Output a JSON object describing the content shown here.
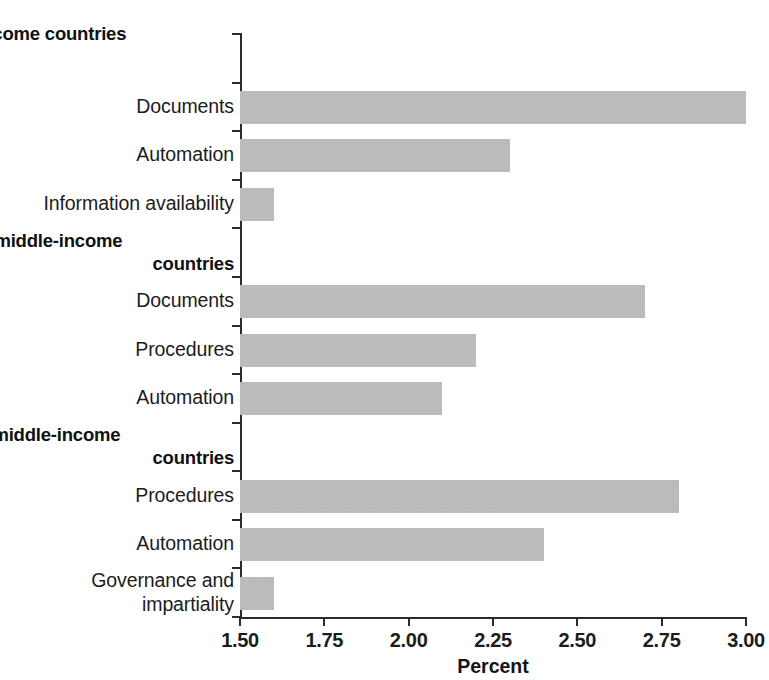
{
  "chart_data": {
    "type": "bar",
    "orientation": "horizontal",
    "title": "",
    "xlabel": "Percent",
    "ylabel": "",
    "xlim": [
      1.5,
      3.0
    ],
    "xticks": [
      "1.50",
      "1.75",
      "2.00",
      "2.25",
      "2.50",
      "2.75",
      "3.00"
    ],
    "xtick_values": [
      1.5,
      1.75,
      2.0,
      2.25,
      2.5,
      2.75,
      3.0
    ],
    "grid": false,
    "legend": null,
    "bar_color": "#b3b3b3",
    "axis_color": "#2b2b2b",
    "panels": [
      {
        "key": "a",
        "title": "a. Low-income countries",
        "title_lines": [
          "a. Low-income countries"
        ],
        "categories": [
          "Documents",
          "Automation",
          "Information availability"
        ],
        "values": [
          3.0,
          2.3,
          1.6
        ]
      },
      {
        "key": "b",
        "title": "b. Lower-middle-income countries",
        "title_lines": [
          "b. Lower-middle-income",
          "countries"
        ],
        "categories": [
          "Documents",
          "Procedures",
          "Automation"
        ],
        "values": [
          2.7,
          2.2,
          2.1
        ]
      },
      {
        "key": "c",
        "title": "c. Upper-middle-income countries",
        "title_lines": [
          "c. Upper-middle-income",
          "countries"
        ],
        "categories": [
          "Procedures",
          "Automation",
          "Governance and impartiality"
        ],
        "values": [
          2.8,
          2.4,
          1.6
        ]
      }
    ],
    "categories": [
      "Documents",
      "Automation",
      "Information availability",
      "Documents",
      "Procedures",
      "Automation",
      "Procedures",
      "Automation",
      "Governance and impartiality"
    ],
    "values": [
      3.0,
      2.3,
      1.6,
      2.7,
      2.2,
      2.1,
      2.8,
      2.4,
      1.6
    ]
  },
  "rows": [
    {
      "kind": "title",
      "panel": 0,
      "line1": "a. Low-income countries",
      "line2": ""
    },
    {
      "kind": "bar",
      "label": "Documents",
      "value": 3.0
    },
    {
      "kind": "bar",
      "label": "Automation",
      "value": 2.3
    },
    {
      "kind": "bar",
      "label": "Information availability",
      "value": 1.6
    },
    {
      "kind": "title",
      "panel": 1,
      "line1": "b. Lower-middle-income",
      "line2": "countries"
    },
    {
      "kind": "bar",
      "label": "Documents",
      "value": 2.7
    },
    {
      "kind": "bar",
      "label": "Procedures",
      "value": 2.2
    },
    {
      "kind": "bar",
      "label": "Automation",
      "value": 2.1
    },
    {
      "kind": "title",
      "panel": 2,
      "line1": "c. Upper-middle-income",
      "line2": "countries"
    },
    {
      "kind": "bar",
      "label": "Procedures",
      "value": 2.8
    },
    {
      "kind": "bar",
      "label": "Automation",
      "value": 2.4
    },
    {
      "kind": "bar",
      "label": "Governance and impartiality",
      "value": 1.6
    }
  ],
  "axis": {
    "x_title": "Percent",
    "ticks": [
      "1.50",
      "1.75",
      "2.00",
      "2.25",
      "2.50",
      "2.75",
      "3.00"
    ]
  }
}
